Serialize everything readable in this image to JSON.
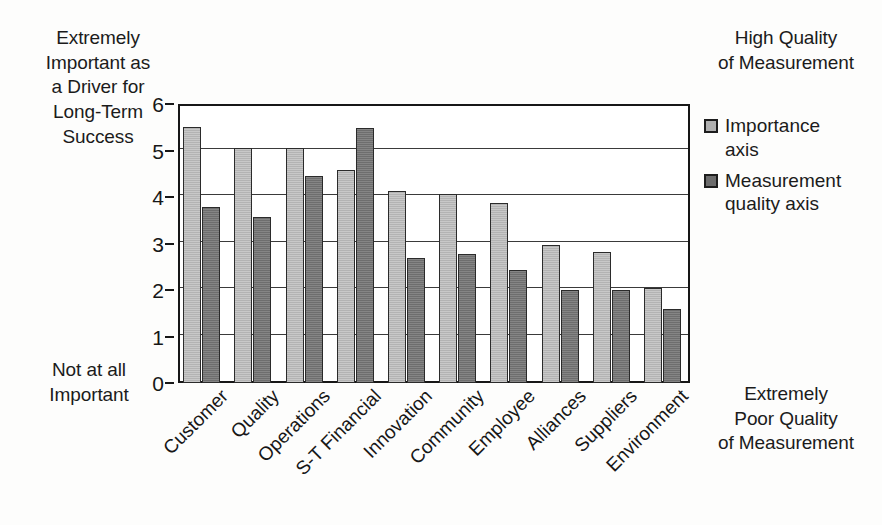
{
  "annotations": {
    "top_left": "Extremely\nImportant as\na Driver for\nLong-Term\nSuccess",
    "bottom_left": "Not at all\nImportant",
    "top_right": "High Quality\nof Measurement",
    "bottom_right": "Extremely\nPoor Quality\nof Measurement"
  },
  "legend": {
    "items": [
      {
        "label": "Importance\naxis",
        "color": "#b0b0b0"
      },
      {
        "label": "Measurement\nquality axis",
        "color": "#6c6c6c"
      }
    ]
  },
  "axis": {
    "y_ticks": [
      "0",
      "1",
      "2",
      "3",
      "4",
      "5",
      "6"
    ]
  },
  "chart_data": {
    "type": "bar",
    "title": "",
    "xlabel": "",
    "ylabel": "",
    "ylim": [
      0,
      6
    ],
    "yticks": [
      0,
      1,
      2,
      3,
      4,
      5,
      6
    ],
    "grid": true,
    "legend_position": "right",
    "categories": [
      "Customer",
      "Quality",
      "Operations",
      "S-T Financial",
      "Innovation",
      "Community",
      "Employee",
      "Alliances",
      "Suppliers",
      "Environment"
    ],
    "series": [
      {
        "name": "Importance axis",
        "color": "#b0b0b0",
        "values": [
          5.5,
          5.05,
          5.05,
          4.58,
          4.12,
          4.07,
          3.87,
          2.97,
          2.82,
          2.05
        ]
      },
      {
        "name": "Measurement quality axis",
        "color": "#6c6c6c",
        "values": [
          3.78,
          3.58,
          4.45,
          5.48,
          2.68,
          2.78,
          2.42,
          2.0,
          2.0,
          1.6
        ]
      }
    ]
  }
}
